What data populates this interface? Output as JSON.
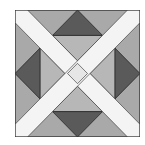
{
  "image": {
    "description": "Quilt block pattern: a square with a white X crossing diagonally, four dark gray triangles pointing outward at each edge midpoint, and medium/light gray background pieces.",
    "colors": {
      "background": "#ffffff",
      "outer_gray": "#a9a9a9",
      "inner_gray": "#b9b9b9",
      "dark_triangle": "#5a5a5a",
      "band_white": "#f4f4f4",
      "center_diamond": "#e6e6e6",
      "outline": "#333333"
    },
    "pieces": {
      "x_bands": 2,
      "dark_triangles": [
        "top",
        "right",
        "bottom",
        "left"
      ],
      "center": "light diamond"
    }
  }
}
